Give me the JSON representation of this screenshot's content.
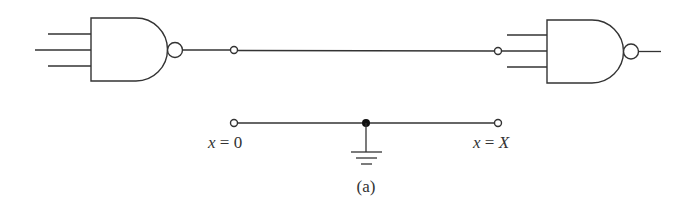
{
  "figure": {
    "caption": "(a)",
    "colors": {
      "stroke": "#333333",
      "background": "#ffffff"
    }
  },
  "components": {
    "left_gate": {
      "type": "NAND",
      "inputs": 3,
      "name": "left NAND gate"
    },
    "right_gate": {
      "type": "NAND",
      "inputs": 3,
      "name": "right NAND gate"
    },
    "interconnect": {
      "type": "wire",
      "from": "left_gate.output",
      "to": "right_gate.input_2"
    },
    "equivalent_line": {
      "type": "transmission line",
      "ground": "ground symbol at midpoint",
      "labels": {
        "start_var": "x",
        "start_eq": " = 0",
        "end_var": "x",
        "end_eq": " = ",
        "end_val": "X"
      }
    }
  }
}
